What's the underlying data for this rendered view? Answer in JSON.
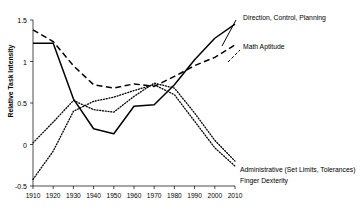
{
  "chart_data": {
    "type": "line",
    "title": "",
    "xlabel": "",
    "ylabel": "Relative Task Intensity",
    "xlim": [
      1910,
      2010
    ],
    "ylim": [
      -0.5,
      1.5
    ],
    "grid": false,
    "legend_position": "inline-annotations",
    "x": [
      1910,
      1920,
      1930,
      1940,
      1950,
      1960,
      1970,
      1980,
      1990,
      2000,
      2010
    ],
    "xtick_labels": [
      "1910",
      "1920",
      "1930",
      "1940",
      "1950",
      "1960",
      "1970",
      "1980",
      "1990",
      "2000",
      "2010"
    ],
    "ytick_labels": [
      "1.5",
      "1",
      "0.5",
      "0",
      "-0.5"
    ],
    "ytick_values": [
      1.5,
      1,
      0.5,
      0,
      -0.5
    ],
    "series": [
      {
        "name": "Direction, Control, Planning",
        "style": "solid",
        "color": "#000000",
        "values": [
          1.22,
          1.22,
          0.55,
          0.19,
          0.13,
          0.46,
          0.48,
          0.72,
          1.02,
          1.28,
          1.45
        ]
      },
      {
        "name": "Math Aptitude",
        "style": "dashed",
        "color": "#000000",
        "values": [
          1.38,
          1.24,
          0.95,
          0.72,
          0.68,
          0.73,
          0.7,
          0.82,
          0.95,
          1.05,
          1.2
        ]
      },
      {
        "name": "Administrative (Set Limits, Tolerances)",
        "style": "dotted",
        "color": "#000000",
        "values": [
          0.02,
          0.27,
          0.53,
          0.42,
          0.39,
          0.58,
          0.74,
          0.68,
          0.38,
          0.05,
          -0.2
        ]
      },
      {
        "name": "Finger Dexterity",
        "style": "dotted",
        "color": "#000000",
        "values": [
          -0.42,
          -0.08,
          0.4,
          0.52,
          0.57,
          0.65,
          0.72,
          0.6,
          0.28,
          -0.04,
          -0.26
        ]
      }
    ],
    "annotations": [
      {
        "text": "Direction, Control, Planning",
        "x": 2000,
        "y": 1.36
      },
      {
        "text": "Math Aptitude",
        "x": 2000,
        "y": 1.02
      },
      {
        "text": "Administrative (Set Limits, Tolerances)",
        "x": 2005,
        "y": -0.32
      },
      {
        "text": "Finger Dexterity",
        "x": 2005,
        "y": -0.44
      }
    ]
  }
}
